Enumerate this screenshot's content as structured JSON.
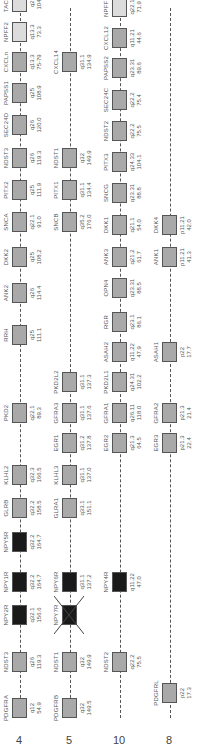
{
  "colors": {
    "light": "#dcdcdc",
    "medium": "#a9a9a9",
    "dark": "#1a1a1a",
    "line": "#555555"
  },
  "tracks": [
    {
      "chromosome": "4",
      "y": 20,
      "line": [
        30,
        740
      ],
      "genes": [
        {
          "name": "PDGFRA",
          "band": "q12",
          "pos": "54.9",
          "x": 20,
          "shade": "medium"
        },
        {
          "name": "NDST3",
          "band": "q26",
          "pos": "119.3",
          "x": 66,
          "shade": "medium"
        },
        {
          "name": "NPY2R",
          "band": "q32.1",
          "pos": "156.6",
          "x": 113,
          "shade": "dark"
        },
        {
          "name": "NPY1R",
          "band": "q32.2",
          "pos": "164.7",
          "x": 146,
          "shade": "dark"
        },
        {
          "name": "NPY5R",
          "band": "q32.2",
          "pos": "164.7",
          "x": 186,
          "shade": "dark"
        },
        {
          "name": "GLRB",
          "band": "q32.2",
          "pos": "158.5",
          "x": 220,
          "shade": "medium"
        },
        {
          "name": "KLHL2",
          "band": "q32.3",
          "pos": "166.5",
          "x": 253,
          "shade": "medium"
        },
        {
          "name": "PKD2",
          "band": "q22.1",
          "pos": "89.3",
          "x": 315,
          "shade": "medium"
        },
        {
          "name": "RRH",
          "band": "q25",
          "pos": "111.1",
          "x": 393,
          "shade": "medium"
        },
        {
          "name": "ANK2",
          "band": "q26",
          "pos": "114.4",
          "x": 435,
          "shade": "medium"
        },
        {
          "name": "DKK2",
          "band": "q25",
          "pos": "108.2",
          "x": 471,
          "shade": "medium"
        },
        {
          "name": "SNCA",
          "band": "q22.1",
          "pos": "91.0",
          "x": 506,
          "shade": "medium"
        },
        {
          "name": "PITX2",
          "band": "q25",
          "pos": "111.9",
          "x": 538,
          "shade": "medium"
        },
        {
          "name": "NDST3",
          "band": "q26",
          "pos": "119.3",
          "x": 570,
          "shade": "medium"
        },
        {
          "name": "SEC24D",
          "band": "q26",
          "pos": "120.0",
          "x": 603,
          "shade": "medium"
        },
        {
          "name": "PAPSS1",
          "band": "q25",
          "pos": "108.9",
          "x": 635,
          "shade": "medium"
        },
        {
          "name": "CXCLn",
          "band": "q13.3",
          "pos": "75-79",
          "x": 666,
          "shade": "medium"
        },
        {
          "name": "NPFF2",
          "band": "q13.3",
          "pos": "73.3",
          "x": 696,
          "shade": "light"
        },
        {
          "name": "TACR3",
          "band": "q24",
          "pos": "104.9",
          "x": 726,
          "shade": "light"
        }
      ]
    },
    {
      "chromosome": "5",
      "y": 70,
      "line": [
        30,
        740
      ],
      "genes": [
        {
          "name": "PDGFRB",
          "band": "q32",
          "pos": "149.5",
          "x": 20,
          "shade": "medium"
        },
        {
          "name": "NDST1",
          "band": "q32",
          "pos": "149.9",
          "x": 66,
          "shade": "medium"
        },
        {
          "name": "NPY7R",
          "band": "",
          "pos": "",
          "x": 113,
          "shade": "dark",
          "crossed": true
        },
        {
          "name": "NPY6R",
          "band": "q31.1",
          "pos": "137.2",
          "x": 146,
          "shade": "dark"
        },
        {
          "name": "GLRA1",
          "band": "q33.1",
          "pos": "151.1",
          "x": 220,
          "shade": "medium"
        },
        {
          "name": "KLHL3",
          "band": "q31.1",
          "pos": "137.0",
          "x": 253,
          "shade": "medium"
        },
        {
          "name": "EGR1",
          "band": "q31.2",
          "pos": "137.8",
          "x": 285,
          "shade": "medium"
        },
        {
          "name": "GFRA3",
          "band": "q31.1",
          "pos": "137.6",
          "x": 315,
          "shade": "medium"
        },
        {
          "name": "PKD2L2",
          "band": "q31.1",
          "pos": "137.3",
          "x": 346,
          "shade": "medium"
        },
        {
          "name": "SNCB",
          "band": "q35.2",
          "pos": "176.0",
          "x": 506,
          "shade": "medium"
        },
        {
          "name": "PITX1",
          "band": "q31.1",
          "pos": "134.4",
          "x": 538,
          "shade": "medium"
        },
        {
          "name": "NDST1",
          "band": "q32",
          "pos": "149.9",
          "x": 570,
          "shade": "medium"
        },
        {
          "name": "CXCL14",
          "band": "q31.1",
          "pos": "134.9",
          "x": 666,
          "shade": "medium"
        }
      ]
    },
    {
      "chromosome": "10",
      "y": 120,
      "line": [
        30,
        740
      ],
      "genes": [
        {
          "name": "NDST2",
          "band": "q22.2",
          "pos": "75.5",
          "x": 66,
          "shade": "medium"
        },
        {
          "name": "NPY4R",
          "band": "q11.22",
          "pos": "47.0",
          "x": 146,
          "shade": "dark"
        },
        {
          "name": "EGR2",
          "band": "q21.3",
          "pos": "64.5",
          "x": 285,
          "shade": "medium"
        },
        {
          "name": "GFRA1",
          "band": "q26.11",
          "pos": "118.0",
          "x": 315,
          "shade": "medium"
        },
        {
          "name": "PKD2L1",
          "band": "q24.31",
          "pos": "102.2",
          "x": 346,
          "shade": "medium"
        },
        {
          "name": "ASAH2",
          "band": "q11.22",
          "pos": "47.9",
          "x": 376,
          "shade": "medium"
        },
        {
          "name": "RGR",
          "band": "q23.1",
          "pos": "86.1",
          "x": 406,
          "shade": "medium"
        },
        {
          "name": "OPN4",
          "band": "q23.31",
          "pos": "88.5",
          "x": 440,
          "shade": "medium"
        },
        {
          "name": "ANK3",
          "band": "q21.2",
          "pos": "61.7",
          "x": 471,
          "shade": "medium"
        },
        {
          "name": "DKK1",
          "band": "q21.1",
          "pos": "54.0",
          "x": 503,
          "shade": "medium"
        },
        {
          "name": "SNCG",
          "band": "q23.31",
          "pos": "88.8",
          "x": 535,
          "shade": "medium"
        },
        {
          "name": "PITX3",
          "band": "q24.33",
          "pos": "104.1",
          "x": 566,
          "shade": "medium"
        },
        {
          "name": "NDST2",
          "band": "q22.2",
          "pos": "75.5",
          "x": 597,
          "shade": "medium"
        },
        {
          "name": "SEC24C",
          "band": "q22.2",
          "pos": "75.4",
          "x": 628,
          "shade": "medium"
        },
        {
          "name": "PAPSS2",
          "band": "q23.31",
          "pos": "89.6",
          "x": 660,
          "shade": "medium"
        },
        {
          "name": "CXCL12",
          "band": "q11.21",
          "pos": "44.6",
          "x": 690,
          "shade": "medium"
        },
        {
          "name": "NPFF1",
          "band": "q22.1",
          "pos": "71.9",
          "x": 721,
          "shade": "light"
        },
        {
          "name": "TACR2",
          "band": "q22.1",
          "pos": "71.1",
          "x": 752,
          "shade": "light"
        }
      ]
    },
    {
      "chromosome": "8",
      "y": 170,
      "line": [
        30,
        740
      ],
      "genes": [
        {
          "name": "PDGFRL",
          "band": "p22",
          "pos": "17.3",
          "x": 35,
          "shade": "medium"
        },
        {
          "name": "EGR3",
          "band": "p21.3",
          "pos": "22.4",
          "x": 285,
          "shade": "medium"
        },
        {
          "name": "GFRA2",
          "band": "p21.3",
          "pos": "21.4",
          "x": 315,
          "shade": "medium"
        },
        {
          "name": "ASAH1",
          "band": "p22",
          "pos": "17.7",
          "x": 376,
          "shade": "medium"
        },
        {
          "name": "ANK1",
          "band": "p11.21",
          "pos": "41.3",
          "x": 471,
          "shade": "medium"
        },
        {
          "name": "DKK4",
          "band": "p11.21",
          "pos": "42.0",
          "x": 503,
          "shade": "medium"
        }
      ]
    }
  ]
}
